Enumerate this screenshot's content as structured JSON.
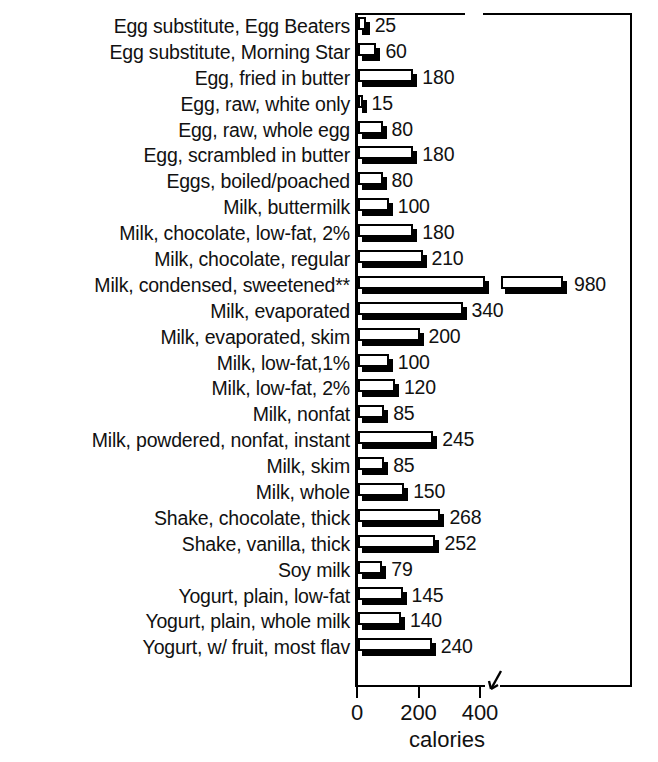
{
  "title_remnant": "CALORIES",
  "chart_data": {
    "type": "bar",
    "orientation": "horizontal",
    "title": "",
    "xlabel": "calories",
    "ylabel": "",
    "xlim": [
      0,
      420
    ],
    "xticks": [
      0,
      200,
      400
    ],
    "xtick_labels": [
      "0",
      "200",
      "400"
    ],
    "grid": false,
    "legend": null,
    "axis_break": true,
    "axis_break_note": "x-axis is broken after 400; the 980 bar is drawn split with a gap",
    "footnote_marker": "**",
    "categories": [
      "Egg substitute, Egg Beaters",
      "Egg substitute, Morning Star",
      "Egg, fried in butter",
      "Egg, raw, white only",
      "Egg, raw, whole egg",
      "Egg, scrambled in butter",
      "Eggs, boiled/poached",
      "Milk, buttermilk",
      "Milk, chocolate, low-fat, 2%",
      "Milk, chocolate, regular",
      "Milk, condensed, sweetened**",
      "Milk, evaporated",
      "Milk, evaporated, skim",
      "Milk, low-fat,1%",
      "Milk, low-fat, 2%",
      "Milk, nonfat",
      "Milk, powdered, nonfat, instant",
      "Milk, skim",
      "Milk, whole",
      "Shake, chocolate, thick",
      "Shake, vanilla, thick",
      "Soy milk",
      "Yogurt, plain, low-fat",
      "Yogurt, plain, whole milk",
      "Yogurt, w/ fruit, most flav"
    ],
    "values": [
      25,
      60,
      180,
      15,
      80,
      180,
      80,
      100,
      180,
      210,
      980,
      340,
      200,
      100,
      120,
      85,
      245,
      85,
      150,
      268,
      252,
      79,
      145,
      140,
      240
    ],
    "value_labels": [
      "25",
      "60",
      "180",
      "15",
      "80",
      "180",
      "80",
      "100",
      "180",
      "210",
      "980",
      "340",
      "200",
      "100",
      "120",
      "85",
      "245",
      "85",
      "150",
      "268",
      "252",
      "79",
      "145",
      "140",
      "240"
    ]
  },
  "colors": {
    "bar_face": "#ffffff",
    "bar_outline": "#000000",
    "bar_shadow": "#000000",
    "text": "#111111",
    "background": "#ffffff"
  }
}
